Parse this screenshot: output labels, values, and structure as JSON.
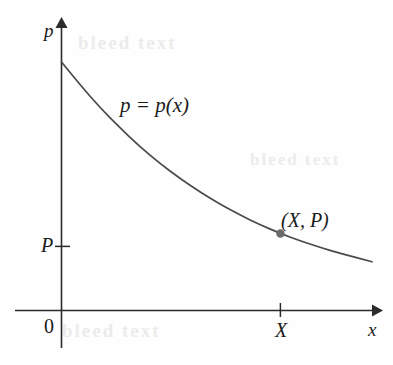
{
  "figure": {
    "kind": "math-diagram",
    "background_color": "#fefefe",
    "ink_color": "#2b2b2b",
    "curve_color": "#4a4a4a",
    "point_color": "#6b6b6b"
  },
  "axes": {
    "y_axis_label": "p",
    "x_axis_label": "x",
    "origin_label": "0",
    "y_tick_label": "P",
    "x_tick_label": "X"
  },
  "annotations": {
    "curve_label": "p = p(x)",
    "point_label": "(X, P)"
  },
  "bleed_through": {
    "top": "bleed text",
    "middle": "bleed text",
    "bottom": "bleed text"
  },
  "chart_data": {
    "type": "line",
    "title": "",
    "xlabel": "x",
    "ylabel": "p",
    "grid": false,
    "legend": null,
    "axis_arrows": [
      "x",
      "p"
    ],
    "xlim": [
      0,
      1
    ],
    "ylim": [
      0,
      1
    ],
    "x_ticks": [
      {
        "value": 0,
        "label": "0"
      },
      {
        "value": 0.705,
        "label": "X"
      }
    ],
    "y_ticks": [
      {
        "value": 0,
        "label": "0"
      },
      {
        "value": 0.258,
        "label": "P"
      }
    ],
    "series": [
      {
        "name": "p = p(x)",
        "comment": "decreasing convex demand curve, normalized units",
        "x": [
          0.0,
          0.062,
          0.125,
          0.19,
          0.253,
          0.317,
          0.382,
          0.446,
          0.51,
          0.575,
          0.64,
          0.705,
          0.77,
          0.835,
          0.9,
          1.0
        ],
        "y": [
          1.0,
          0.905,
          0.815,
          0.733,
          0.659,
          0.592,
          0.531,
          0.477,
          0.428,
          0.384,
          0.345,
          0.31,
          0.28,
          0.253,
          0.229,
          0.196
        ]
      }
    ],
    "annotated_points": [
      {
        "label": "(X, P)",
        "x": 0.705,
        "y": 0.31
      }
    ]
  }
}
